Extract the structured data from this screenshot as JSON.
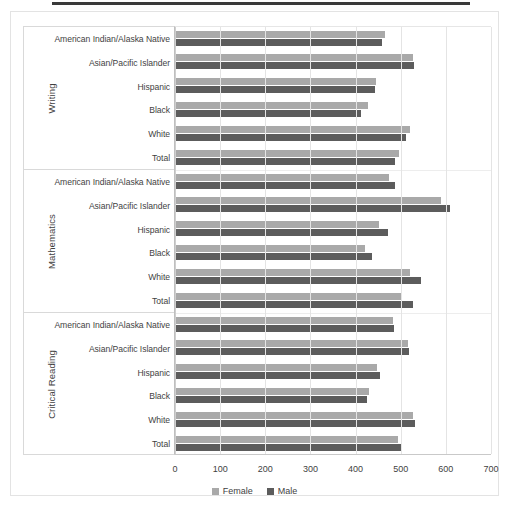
{
  "chart_data": {
    "type": "bar",
    "title": "",
    "orientation": "horizontal",
    "xlabel": "",
    "ylabel": "",
    "xlim": [
      0,
      700
    ],
    "xticks": [
      0,
      100,
      200,
      300,
      400,
      500,
      600,
      700
    ],
    "grid": true,
    "legend_position": "bottom",
    "legend": [
      "Female",
      "Male"
    ],
    "colors": {
      "female": "#a9a9a9",
      "male": "#5c5c5c"
    },
    "groups": [
      {
        "name": "Writing",
        "categories": [
          "American Indian/Alaska Native",
          "Asian/Pacific Islander",
          "Hispanic",
          "Black",
          "White",
          "Total"
        ],
        "series": [
          {
            "name": "Female",
            "values": [
              466,
              528,
              446,
              428,
              521,
              496
            ]
          },
          {
            "name": "Male",
            "values": [
              459,
              530,
              442,
              411,
              512,
              488
            ]
          }
        ]
      },
      {
        "name": "Mathematics",
        "categories": [
          "American Indian/Alaska Native",
          "Asian/Pacific Islander",
          "Hispanic",
          "Black",
          "White",
          "Total"
        ],
        "series": [
          {
            "name": "Female",
            "values": [
              474,
              589,
              452,
              420,
              520,
              500
            ]
          },
          {
            "name": "Male",
            "values": [
              487,
              609,
              472,
              437,
              545,
              527
            ]
          }
        ]
      },
      {
        "name": "Critical Reading",
        "categories": [
          "American Indian/Alaska Native",
          "Asian/Pacific Islander",
          "Hispanic",
          "Black",
          "White",
          "Total"
        ],
        "series": [
          {
            "name": "Female",
            "values": [
              482,
              516,
              448,
              430,
              527,
              495
            ]
          },
          {
            "name": "Male",
            "values": [
              486,
              519,
              455,
              425,
              531,
              500
            ]
          }
        ]
      }
    ]
  }
}
